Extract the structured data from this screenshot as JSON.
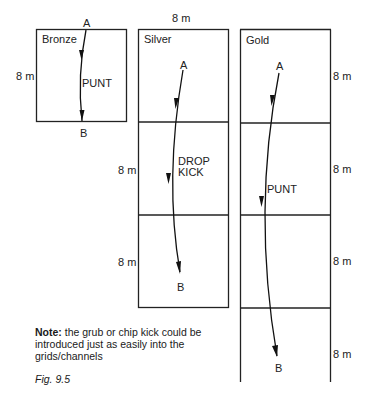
{
  "figure": {
    "caption": "Fig. 9.5",
    "note_label": "Note:",
    "note_text": " the grub or chip kick could be introduced just as easily into the grids/channels",
    "width_label": "8 m"
  },
  "grids": [
    {
      "name": "Bronze",
      "cells": 1,
      "cell_size_label": "8 m",
      "kick": "PUNT",
      "start": "A",
      "end": "B"
    },
    {
      "name": "Silver",
      "cells": 3,
      "cell_size_labels": [
        "8 m",
        "8 m"
      ],
      "kick": "DROP\nKICK",
      "kick_line1": "DROP",
      "kick_line2": "KICK",
      "start": "A",
      "end": "B"
    },
    {
      "name": "Gold",
      "cells": 4,
      "cell_size_labels": [
        "8 m",
        "8 m",
        "8 m",
        "8 m"
      ],
      "kick": "PUNT",
      "start": "A",
      "end": "B"
    }
  ]
}
